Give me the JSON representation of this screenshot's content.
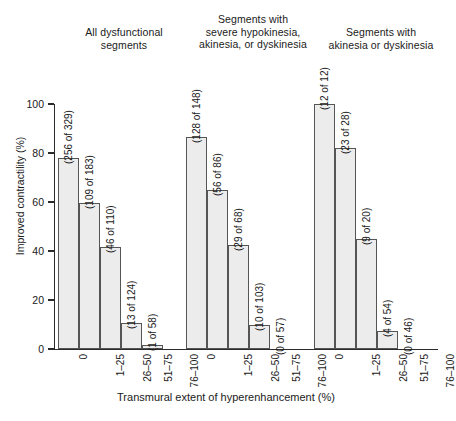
{
  "chart_data": {
    "type": "bar",
    "title": "",
    "xlabel": "Transmural extent of hyperenhancement (%)",
    "ylabel": "Improved contractility (%)",
    "ylim": [
      0,
      100
    ],
    "ytick_labels": [
      "0",
      "20",
      "40",
      "60",
      "80",
      "100"
    ],
    "ytick_values": [
      0,
      20,
      40,
      60,
      80,
      100
    ],
    "grid": false,
    "legend": "none",
    "categories": [
      "0",
      "1–25",
      "26–50",
      "51–75",
      "76–100"
    ],
    "panels": [
      {
        "header": "All dysfunctional\nsegments",
        "values": [
          77.8,
          59.6,
          41.8,
          10.5,
          1.7
        ],
        "point_labels": [
          "(256 of 329)",
          "(109 of 183)",
          "(46 of 110)",
          "(13 of 124)",
          "(1 of 58)"
        ],
        "numerators": [
          256,
          109,
          46,
          13,
          1
        ],
        "denominators": [
          329,
          183,
          110,
          124,
          58
        ]
      },
      {
        "header": "Segments with\nsevere hypokinesia,\nakinesia, or dyskinesia",
        "values": [
          86.5,
          65.1,
          42.6,
          9.7,
          0.0
        ],
        "point_labels": [
          "(128 of 148)",
          "(56 of 86)",
          "(29 of 68)",
          "(10 of 103)",
          "(0 of 57)"
        ],
        "numerators": [
          128,
          56,
          29,
          10,
          0
        ],
        "denominators": [
          148,
          86,
          68,
          103,
          57
        ]
      },
      {
        "header": "Segments with\nakinesia or dyskinesia",
        "values": [
          100.0,
          82.1,
          45.0,
          7.4,
          0.0
        ],
        "point_labels": [
          "(12 of 12)",
          "(23 of 28)",
          "(9 of 20)",
          "(4 of 54)",
          "(0 of 46)"
        ],
        "numerators": [
          12,
          23,
          9,
          4,
          0
        ],
        "denominators": [
          12,
          28,
          20,
          54,
          46
        ]
      }
    ],
    "colors": {
      "bar_fill": "#ececec",
      "bar_stroke": "#555555",
      "axis": "#2b2b2b",
      "text": "#1a1a1a",
      "background": "#ffffff"
    }
  }
}
